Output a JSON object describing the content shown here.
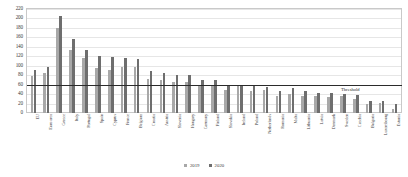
{
  "chart_data": {
    "type": "bar",
    "title": "",
    "subtitle": "",
    "xlabel": "",
    "ylabel": "",
    "ylim": [
      0,
      220
    ],
    "ytick_step": 20,
    "yticks": [
      0,
      20,
      40,
      60,
      80,
      100,
      120,
      140,
      160,
      180,
      200,
      220
    ],
    "grid": true,
    "legend_position": "bottom-center",
    "categories": [
      "EU",
      "Euro area",
      "Greece",
      "Italy",
      "Portugal",
      "Spain",
      "Cyprus",
      "France",
      "Belgium",
      "Croatia",
      "Austria",
      "Slovenia",
      "Hungary",
      "Germany",
      "Finland",
      "Slovakia",
      "Ireland",
      "Poland",
      "Netherlands",
      "Romania",
      "Malta",
      "Lithuania",
      "Latvia",
      "Denmark",
      "Sweden",
      "Czechia",
      "Bulgaria",
      "Luxembourg",
      "Estonia"
    ],
    "series": [
      {
        "name": "2019",
        "color": "#a8a8a8",
        "values": [
          79,
          84,
          180,
          134,
          116,
          95,
          91,
          97,
          98,
          72,
          70,
          65,
          65,
          59,
          59,
          48,
          57,
          46,
          48,
          35,
          41,
          36,
          37,
          33,
          35,
          30,
          20,
          22,
          9
        ]
      },
      {
        "name": "2020",
        "color": "#6e6e6e",
        "values": [
          90,
          98,
          205,
          156,
          133,
          120,
          118,
          116,
          115,
          88,
          84,
          80,
          80,
          69,
          69,
          60,
          59,
          57,
          54,
          47,
          53,
          47,
          43,
          42,
          40,
          38,
          25,
          25,
          19
        ]
      }
    ],
    "threshold": {
      "label": "Threshold",
      "value": 60,
      "color": "#2b2b2b"
    }
  }
}
